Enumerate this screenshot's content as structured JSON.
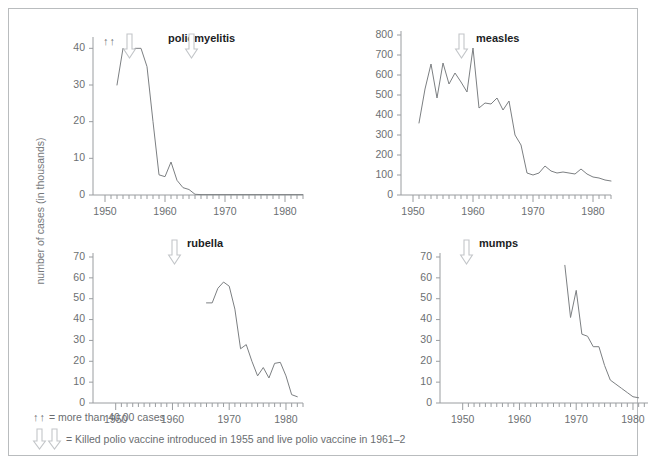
{
  "figure": {
    "y_axis_label": "number of cases (in thousands)",
    "legend": [
      {
        "glyph": "double-up-arrow",
        "text": "= more than 40,00 cases"
      },
      {
        "glyph": "double-down-arrow",
        "text": "= Killed polio vaccine introduced in 1955 and live polio vaccine in 1961–2"
      }
    ]
  },
  "chart_data": [
    {
      "id": "poliomyelitis",
      "type": "line",
      "title": "poliomyelitis",
      "xlabel": "",
      "ylabel": "number of cases (in thousands)",
      "xlim": [
        1948,
        1983
      ],
      "ylim": [
        0,
        42
      ],
      "yticks": [
        0,
        10,
        20,
        30,
        40
      ],
      "xticks": [
        1950,
        1960,
        1970,
        1980
      ],
      "grid": false,
      "annotations": [
        {
          "kind": "up-arrows",
          "label": "↑↑",
          "x": 1953
        },
        {
          "kind": "down-arrow",
          "x": 1955
        },
        {
          "kind": "down-arrow",
          "x": 1961.5
        }
      ],
      "x": [
        1952,
        1953,
        1954,
        1955,
        1956,
        1957,
        1958,
        1959,
        1960,
        1961,
        1962,
        1963,
        1964,
        1965,
        1966,
        1967,
        1968,
        1969,
        1970,
        1971,
        1972,
        1973,
        1974,
        1975,
        1976,
        1977,
        1978,
        1979,
        1980,
        1981,
        1982,
        1983
      ],
      "values": [
        30,
        40,
        38,
        40,
        40,
        35,
        20,
        5.5,
        5,
        9,
        4,
        2,
        1.5,
        0.2,
        0.1,
        0.1,
        0.1,
        0.1,
        0.1,
        0.1,
        0.1,
        0.1,
        0.1,
        0.1,
        0.1,
        0.1,
        0.1,
        0.1,
        0.1,
        0.1,
        0.1,
        0.1
      ]
    },
    {
      "id": "measles",
      "type": "line",
      "title": "measles",
      "xlabel": "",
      "ylabel": "number of cases (in thousands)",
      "xlim": [
        1948,
        1983
      ],
      "ylim": [
        0,
        800
      ],
      "yticks": [
        0,
        100,
        200,
        300,
        400,
        500,
        600,
        700,
        800
      ],
      "xticks": [
        1950,
        1960,
        1970,
        1980
      ],
      "grid": false,
      "annotations": [
        {
          "kind": "down-arrow",
          "x": 1964
        }
      ],
      "x": [
        1951,
        1952,
        1953,
        1954,
        1955,
        1956,
        1957,
        1958,
        1959,
        1960,
        1961,
        1962,
        1963,
        1964,
        1965,
        1966,
        1967,
        1968,
        1969,
        1970,
        1971,
        1972,
        1973,
        1974,
        1975,
        1976,
        1977,
        1978,
        1979,
        1980,
        1981,
        1982,
        1983
      ],
      "values": [
        360,
        530,
        655,
        485,
        660,
        555,
        610,
        565,
        515,
        735,
        435,
        460,
        455,
        485,
        425,
        470,
        300,
        250,
        110,
        100,
        110,
        145,
        120,
        110,
        115,
        110,
        105,
        130,
        105,
        90,
        85,
        75,
        70
      ]
    },
    {
      "id": "rubella",
      "type": "line",
      "title": "rubella",
      "xlabel": "",
      "ylabel": "number of cases (in thousands)",
      "xlim": [
        1946,
        1983
      ],
      "ylim": [
        0,
        70
      ],
      "yticks": [
        0,
        10,
        20,
        30,
        40,
        50,
        60,
        70
      ],
      "xticks": [
        1950,
        1960,
        1970,
        1980
      ],
      "grid": false,
      "annotations": [
        {
          "kind": "down-arrow",
          "x": 1969
        }
      ],
      "x": [
        1966,
        1967,
        1968,
        1969,
        1970,
        1971,
        1972,
        1973,
        1974,
        1975,
        1976,
        1977,
        1978,
        1979,
        1980,
        1981,
        1982
      ],
      "values": [
        48,
        48,
        55,
        58,
        56,
        45,
        26,
        28,
        20,
        13,
        17,
        12,
        19,
        19.5,
        13,
        4,
        3
      ]
    },
    {
      "id": "mumps",
      "type": "line",
      "title": "mumps",
      "xlabel": "",
      "ylabel": "number of cases (in thousands)",
      "xlim": [
        1946,
        1983
      ],
      "ylim": [
        0,
        70
      ],
      "yticks": [
        0,
        10,
        20,
        30,
        40,
        50,
        60,
        70
      ],
      "xticks": [
        1950,
        1960,
        1970,
        1980
      ],
      "grid": false,
      "annotations": [
        {
          "kind": "down-arrow",
          "x": 1967
        }
      ],
      "x": [
        1968,
        1969,
        1970,
        1971,
        1972,
        1973,
        1974,
        1975,
        1976,
        1977,
        1978,
        1979,
        1980,
        1981
      ],
      "values": [
        66,
        41,
        54,
        33,
        32,
        27,
        27,
        18,
        11,
        9,
        7,
        5,
        3,
        2.5
      ]
    }
  ]
}
